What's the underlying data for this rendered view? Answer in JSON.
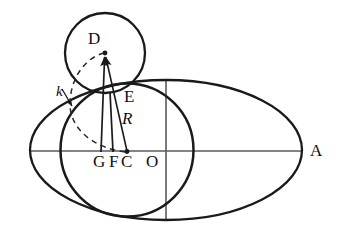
{
  "figure": {
    "type": "geometry-diagram",
    "background_color": "#ffffff",
    "stroke_color": "#1a1a1a",
    "axis_color": "#55555a",
    "labels": [
      {
        "id": "D",
        "text": "D",
        "style": "roman",
        "x": 88,
        "y": 30,
        "size": 17
      },
      {
        "id": "k",
        "text": "k",
        "style": "italic",
        "x": 56,
        "y": 84,
        "size": 15
      },
      {
        "id": "E",
        "text": "E",
        "style": "roman",
        "x": 124,
        "y": 88,
        "size": 17
      },
      {
        "id": "R",
        "text": "R",
        "style": "italic",
        "x": 122,
        "y": 110,
        "size": 17
      },
      {
        "id": "G",
        "text": "G",
        "style": "roman",
        "x": 93,
        "y": 147,
        "size": 17
      },
      {
        "id": "F",
        "text": "F",
        "style": "roman",
        "x": 108,
        "y": 147,
        "size": 17
      },
      {
        "id": "C",
        "text": "C",
        "style": "roman",
        "x": 121,
        "y": 147,
        "size": 17
      },
      {
        "id": "O",
        "text": "O",
        "style": "roman",
        "x": 145,
        "y": 147,
        "size": 17
      },
      {
        "id": "A",
        "text": "A",
        "style": "roman",
        "x": 310,
        "y": 143,
        "size": 17
      }
    ],
    "points": {
      "D": {
        "x": 105,
        "y": 52
      },
      "tangency": {
        "x": 110,
        "y": 92
      },
      "G": {
        "x": 100,
        "y": 152
      },
      "F": {
        "x": 113,
        "y": 152
      },
      "C": {
        "x": 127,
        "y": 152
      },
      "O": {
        "x": 166,
        "y": 152
      },
      "A": {
        "x": 305,
        "y": 152
      }
    },
    "shapes": {
      "ellipse": {
        "cx": 166,
        "cy": 150,
        "rx": 136,
        "ry": 70
      },
      "big_circle": {
        "cx": 127,
        "cy": 152,
        "r": 67
      },
      "small_circle": {
        "cx": 105,
        "cy": 53,
        "r": 40
      },
      "dashed_curve_k": "arc from D through left of big circle to C"
    }
  }
}
